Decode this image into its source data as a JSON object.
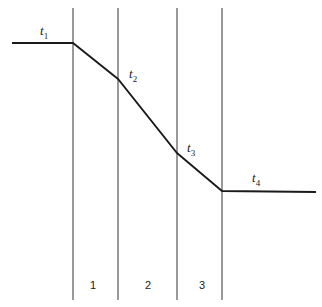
{
  "diagram": {
    "type": "temperature-profile-through-layers",
    "colors": {
      "line": "#1a1a1a",
      "divider": "#555555",
      "background": "#ffffff"
    },
    "dividers_x": [
      73,
      118,
      177,
      222
    ],
    "divider_y_range": [
      8,
      300
    ],
    "profile_points": [
      [
        12,
        43
      ],
      [
        73,
        43
      ],
      [
        118,
        79
      ],
      [
        177,
        153
      ],
      [
        222,
        191
      ],
      [
        316,
        192
      ]
    ],
    "point_labels": [
      {
        "base": "t",
        "sub": "1"
      },
      {
        "base": "t",
        "sub": "2"
      },
      {
        "base": "t",
        "sub": "3"
      },
      {
        "base": "t",
        "sub": "4"
      }
    ],
    "region_labels": [
      "1",
      "2",
      "3"
    ]
  }
}
